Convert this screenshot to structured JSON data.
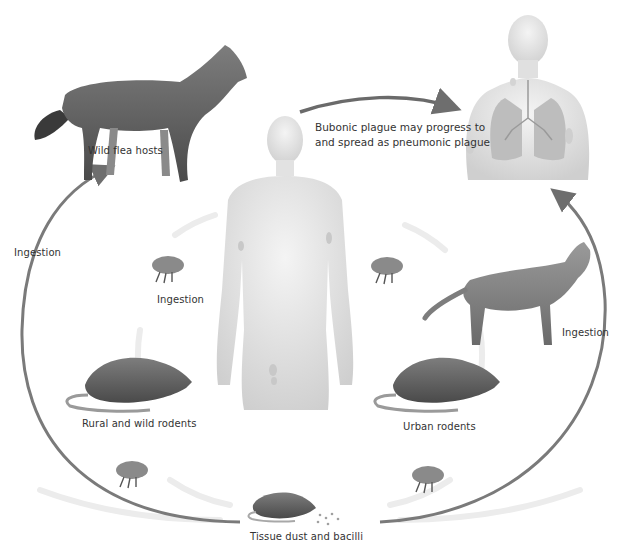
{
  "diagram": {
    "title_elements": {
      "central_human": "Human with bubonic plague (lymph node buboes)",
      "pneumonic_human": "Human with pneumonic plague (lungs)"
    },
    "labels": {
      "wild_flea_hosts": "Wild flea hosts",
      "bubonic_progress_line1": "Bubonic plague may progress to",
      "bubonic_progress_line2": "and spread as pneumonic plague",
      "ingestion_left": "Ingestion",
      "ingestion_flea": "Ingestion",
      "ingestion_right": "Ingestion",
      "rural_rodents": "Rural and wild rodents",
      "urban_rodents": "Urban rodents",
      "tissue_dust": "Tissue dust and bacilli"
    },
    "nodes": [
      {
        "id": "wolf",
        "label": "Wild flea hosts",
        "icon": "wolf-icon"
      },
      {
        "id": "flea-upper-left",
        "label": "Ingestion",
        "icon": "flea-icon"
      },
      {
        "id": "flea-upper-right",
        "label": "",
        "icon": "flea-icon"
      },
      {
        "id": "rural-rodent",
        "label": "Rural and wild rodents",
        "icon": "rat-icon"
      },
      {
        "id": "urban-rodent",
        "label": "Urban rodents",
        "icon": "rat-icon"
      },
      {
        "id": "cat",
        "label": "",
        "icon": "cat-icon"
      },
      {
        "id": "flea-lower-left",
        "label": "",
        "icon": "flea-icon"
      },
      {
        "id": "flea-lower-right",
        "label": "",
        "icon": "flea-icon"
      },
      {
        "id": "dead-rodent",
        "label": "Tissue dust and bacilli",
        "icon": "rat-icon"
      },
      {
        "id": "central-human",
        "label": "",
        "icon": "human-body-icon"
      },
      {
        "id": "pneumonic-human",
        "label": "",
        "icon": "human-lungs-icon"
      }
    ],
    "edges": [
      {
        "from": "dead-rodent",
        "to": "wolf",
        "label": "Ingestion"
      },
      {
        "from": "central-human",
        "to": "pneumonic-human",
        "label": "Bubonic plague may progress to and spread as pneumonic plague"
      },
      {
        "from": "dead-rodent",
        "to": "pneumonic-human",
        "label": "Ingestion"
      }
    ],
    "colors": {
      "arrow": "#777777",
      "skin": "#e6e6e6",
      "lungs": "#b8b8b8",
      "animal": "#6d6d6d",
      "text": "#333333"
    }
  }
}
